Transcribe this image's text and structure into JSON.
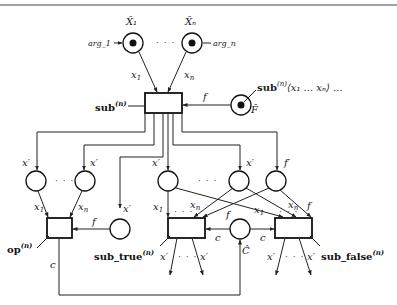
{
  "diagram": {
    "top_rule": true,
    "places": {
      "x1_hat": {
        "label": "X̂₁",
        "arg": "arg_1",
        "marked": true
      },
      "xn_hat": {
        "label": "X̂ₙ",
        "arg": "arg_n",
        "marked": true
      },
      "f_hat": {
        "label": "F̂",
        "marked": true,
        "annotation": "sub⁽ⁿ⁾⟨x₁ ... xₙ⟩ ..."
      },
      "c_hat": {
        "label": "Ĉ",
        "marked": false
      }
    },
    "transitions": {
      "sub": {
        "label": "sub",
        "sup": "(n)"
      },
      "op": {
        "label": "op",
        "sup": "(n)"
      },
      "sub_true": {
        "label": "sub_true",
        "sup": "(n)"
      },
      "sub_false": {
        "label": "sub_false",
        "sup": "(n)"
      }
    },
    "arc_labels": {
      "x1": "x",
      "x1_sub": "1",
      "xn": "x",
      "xn_sub": "n",
      "x1p": "x′",
      "xnp": "x′",
      "xip": "x′",
      "xi_sub": "i",
      "f": "f",
      "fp": "f′",
      "c": "c"
    },
    "ellipsis": "· · ·"
  }
}
